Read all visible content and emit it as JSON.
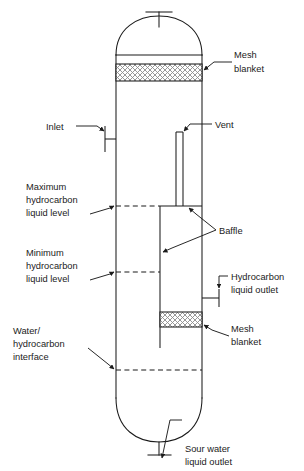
{
  "figure": {
    "type": "process-equipment-diagram",
    "background_color": "#ffffff",
    "line_color": "#1b1b1b",
    "hatch_color": "#8a8a8a",
    "text_color": "#1b1b1b"
  },
  "labels": {
    "mesh_blanket_top": {
      "line1": "Mesh",
      "line2": "blanket"
    },
    "inlet": {
      "line1": "Inlet"
    },
    "vent": {
      "line1": "Vent"
    },
    "max_level": {
      "line1": "Maximum",
      "line2": "hydrocarbon",
      "line3": "liquid level"
    },
    "baffle": {
      "line1": "Baffle"
    },
    "min_level": {
      "line1": "Minimum",
      "line2": "hydrocarbon",
      "line3": "liquid level"
    },
    "hydrocarbon_outlet": {
      "line1": "Hydrocarbon",
      "line2": "liquid outlet"
    },
    "mesh_blanket_bottom": {
      "line1": "Mesh",
      "line2": "blanket"
    },
    "interface": {
      "line1": "Water/",
      "line2": "hydrocarbon",
      "line3": "interface"
    },
    "sour_water_outlet": {
      "line1": "Sour water",
      "line2": "liquid outlet"
    }
  },
  "components": {
    "vessel_shell": "vertical-cylindrical-vessel",
    "top_head": "dished-head",
    "bottom_head": "dished-head",
    "top_nozzle": "tee-nozzle",
    "bottom_nozzle": "tee-nozzle",
    "inlet_nozzle": "side-inlet-nozzle",
    "outlet_nozzle": "side-outlet-nozzle",
    "vent_pipe": "internal-vent-riser",
    "baffle_plate": "internal-vertical-baffle",
    "mesh_pads": 2,
    "level_lines": 3
  }
}
